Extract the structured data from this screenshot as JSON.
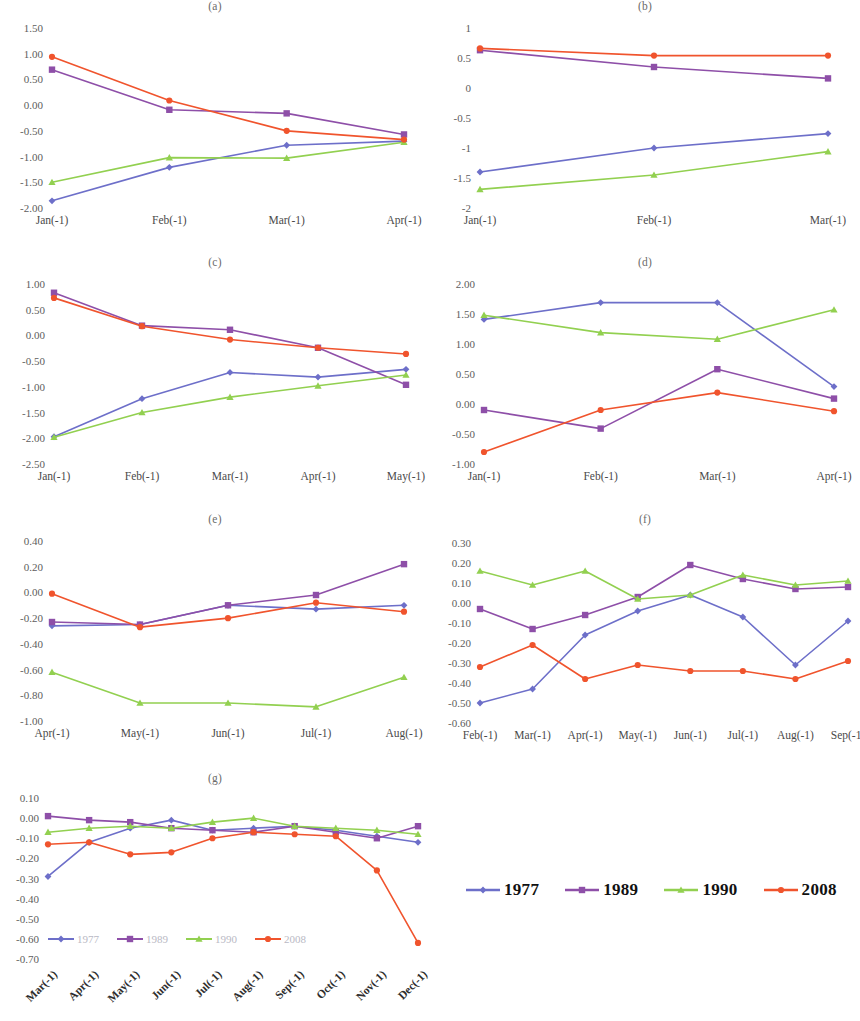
{
  "figure": {
    "background": "#ffffff",
    "width": 860,
    "height": 1021
  },
  "series_meta": [
    {
      "name": "1977",
      "color": "#6d6fc9",
      "marker": "diamond"
    },
    {
      "name": "1989",
      "color": "#8e4fa8",
      "marker": "square"
    },
    {
      "name": "1990",
      "color": "#92d050",
      "marker": "triangle"
    },
    {
      "name": "2008",
      "color": "#f0542d",
      "marker": "circle"
    }
  ],
  "legend_main": {
    "name": "figure-legend",
    "items": [
      {
        "label": "1977",
        "color": "#6d6fc9"
      },
      {
        "label": "1989",
        "color": "#8e4fa8"
      },
      {
        "label": "1990",
        "color": "#92d050"
      },
      {
        "label": "2008",
        "color": "#f0542d"
      }
    ]
  },
  "legend_inner_g": {
    "name": "panel-g-inline-legend",
    "items": [
      {
        "label": "1977",
        "color": "#6d6fc9"
      },
      {
        "label": "1989",
        "color": "#8e4fa8"
      },
      {
        "label": "1990",
        "color": "#92d050"
      },
      {
        "label": "2008",
        "color": "#f0542d"
      }
    ]
  },
  "chart_data": [
    {
      "id": "a",
      "type": "line",
      "title": "(a)",
      "xlabel": "",
      "ylabel": "",
      "grid": false,
      "legend": "none",
      "categories": [
        "Jan(-1)",
        "Feb(-1)",
        "Mar(-1)",
        "Apr(-1)"
      ],
      "yticks": [
        1.5,
        1.0,
        0.5,
        0.0,
        -0.5,
        -1.0,
        -1.5,
        -2.0
      ],
      "ytick_labels": [
        "1.50",
        "1.00",
        "0.50",
        "0.00",
        "-0.50",
        "-1.00",
        "-1.50",
        "-2.00"
      ],
      "ylim": [
        -2.0,
        1.5
      ],
      "series": [
        {
          "name": "1977",
          "color": "#6d6fc9",
          "values": [
            -1.86,
            -1.21,
            -0.78,
            -0.7
          ]
        },
        {
          "name": "1989",
          "color": "#8e4fa8",
          "values": [
            0.69,
            -0.09,
            -0.16,
            -0.57
          ]
        },
        {
          "name": "1990",
          "color": "#92d050",
          "values": [
            -1.5,
            -1.02,
            -1.03,
            -0.72
          ]
        },
        {
          "name": "2008",
          "color": "#f0542d",
          "values": [
            0.94,
            0.09,
            -0.5,
            -0.67
          ]
        }
      ]
    },
    {
      "id": "b",
      "type": "line",
      "title": "(b)",
      "xlabel": "",
      "ylabel": "",
      "grid": false,
      "legend": "none",
      "categories": [
        "Jan(-1)",
        "Feb(-1)",
        "Mar(-1)"
      ],
      "yticks": [
        1,
        0.5,
        0,
        -0.5,
        -1,
        -1.5,
        -2
      ],
      "ytick_labels": [
        "1",
        "0.5",
        "0",
        "-0.5",
        "-1",
        "-1.5",
        "-2"
      ],
      "ylim": [
        -2,
        1
      ],
      "series": [
        {
          "name": "1977",
          "color": "#6d6fc9",
          "values": [
            -1.4,
            -1.0,
            -0.76
          ]
        },
        {
          "name": "1989",
          "color": "#8e4fa8",
          "values": [
            0.63,
            0.35,
            0.16
          ]
        },
        {
          "name": "1990",
          "color": "#92d050",
          "values": [
            -1.69,
            -1.45,
            -1.06
          ]
        },
        {
          "name": "2008",
          "color": "#f0542d",
          "values": [
            0.66,
            0.54,
            0.54
          ]
        }
      ]
    },
    {
      "id": "c",
      "type": "line",
      "title": "(c)",
      "xlabel": "",
      "ylabel": "",
      "grid": false,
      "legend": "none",
      "categories": [
        "Jan(-1)",
        "Feb(-1)",
        "Mar(-1)",
        "Apr(-1)",
        "May(-1)"
      ],
      "yticks": [
        1.0,
        0.5,
        0.0,
        -0.5,
        -1.0,
        -1.5,
        -2.0,
        -2.5
      ],
      "ytick_labels": [
        "1.00",
        "0.50",
        "0.00",
        "-0.50",
        "-1.00",
        "-1.50",
        "-2.00",
        "-2.50"
      ],
      "ylim": [
        -2.5,
        1.0
      ],
      "series": [
        {
          "name": "1977",
          "color": "#6d6fc9",
          "values": [
            -1.97,
            -1.23,
            -0.72,
            -0.81,
            -0.66
          ]
        },
        {
          "name": "1989",
          "color": "#8e4fa8",
          "values": [
            0.83,
            0.19,
            0.11,
            -0.24,
            -0.96
          ]
        },
        {
          "name": "1990",
          "color": "#92d050",
          "values": [
            -1.98,
            -1.5,
            -1.2,
            -0.98,
            -0.77
          ]
        },
        {
          "name": "2008",
          "color": "#f0542d",
          "values": [
            0.73,
            0.18,
            -0.08,
            -0.24,
            -0.36
          ]
        }
      ]
    },
    {
      "id": "d",
      "type": "line",
      "title": "(d)",
      "xlabel": "",
      "ylabel": "",
      "grid": false,
      "legend": "none",
      "categories": [
        "Jan(-1)",
        "Feb(-1)",
        "Mar(-1)",
        "Apr(-1)"
      ],
      "yticks": [
        2.0,
        1.5,
        1.0,
        0.5,
        0.0,
        -0.5,
        -1.0
      ],
      "ytick_labels": [
        "2.00",
        "1.50",
        "1.00",
        "0.50",
        "0.00",
        "-0.50",
        "-1.00"
      ],
      "ylim": [
        -1.0,
        2.0
      ],
      "series": [
        {
          "name": "1977",
          "color": "#6d6fc9",
          "values": [
            1.41,
            1.69,
            1.69,
            0.29
          ]
        },
        {
          "name": "1989",
          "color": "#8e4fa8",
          "values": [
            -0.1,
            -0.41,
            0.58,
            0.09
          ]
        },
        {
          "name": "1990",
          "color": "#92d050",
          "values": [
            1.48,
            1.19,
            1.08,
            1.57
          ]
        },
        {
          "name": "2008",
          "color": "#f0542d",
          "values": [
            -0.8,
            -0.1,
            0.19,
            -0.12
          ]
        }
      ]
    },
    {
      "id": "e",
      "type": "line",
      "title": "(e)",
      "xlabel": "",
      "ylabel": "",
      "grid": false,
      "legend": "none",
      "categories": [
        "Apr(-1)",
        "May(-1)",
        "Jun(-1)",
        "Jul(-1)",
        "Aug(-1)"
      ],
      "yticks": [
        0.4,
        0.2,
        0.0,
        -0.2,
        -0.4,
        -0.6,
        -0.8,
        -1.0
      ],
      "ytick_labels": [
        "0.40",
        "0.20",
        "0.00",
        "-0.20",
        "-0.40",
        "-0.60",
        "-0.80",
        "-1.00"
      ],
      "ylim": [
        -1.0,
        0.4
      ],
      "series": [
        {
          "name": "1977",
          "color": "#6d6fc9",
          "values": [
            -0.26,
            -0.25,
            -0.1,
            -0.13,
            -0.1
          ]
        },
        {
          "name": "1989",
          "color": "#8e4fa8",
          "values": [
            -0.23,
            -0.25,
            -0.1,
            -0.02,
            0.22
          ]
        },
        {
          "name": "1990",
          "color": "#92d050",
          "values": [
            -0.62,
            -0.86,
            -0.86,
            -0.89,
            -0.66
          ]
        },
        {
          "name": "2008",
          "color": "#f0542d",
          "values": [
            -0.01,
            -0.27,
            -0.2,
            -0.08,
            -0.15
          ]
        }
      ]
    },
    {
      "id": "f",
      "type": "line",
      "title": "(f)",
      "xlabel": "",
      "ylabel": "",
      "grid": false,
      "legend": "none",
      "categories": [
        "Feb(-1)",
        "Mar(-1)",
        "Apr(-1)",
        "May(-1)",
        "Jun(-1)",
        "Jul(-1)",
        "Aug(-1)",
        "Sep(-1)"
      ],
      "yticks": [
        0.3,
        0.2,
        0.1,
        0.0,
        -0.1,
        -0.2,
        -0.3,
        -0.4,
        -0.5,
        -0.6
      ],
      "ytick_labels": [
        "0.30",
        "0.20",
        "0.10",
        "0.00",
        "-0.10",
        "-0.20",
        "-0.30",
        "-0.40",
        "-0.50",
        "-0.60"
      ],
      "ylim": [
        -0.6,
        0.3
      ],
      "series": [
        {
          "name": "1977",
          "color": "#6d6fc9",
          "values": [
            -0.5,
            -0.43,
            -0.16,
            -0.04,
            0.04,
            -0.07,
            -0.31,
            -0.09
          ]
        },
        {
          "name": "1989",
          "color": "#8e4fa8",
          "values": [
            -0.03,
            -0.13,
            -0.06,
            0.03,
            0.19,
            0.12,
            0.07,
            0.08
          ]
        },
        {
          "name": "1990",
          "color": "#92d050",
          "values": [
            0.16,
            0.09,
            0.16,
            0.02,
            0.04,
            0.14,
            0.09,
            0.11
          ]
        },
        {
          "name": "2008",
          "color": "#f0542d",
          "values": [
            -0.32,
            -0.21,
            -0.38,
            -0.31,
            -0.34,
            -0.34,
            -0.38,
            -0.29
          ]
        }
      ]
    },
    {
      "id": "g",
      "type": "line",
      "title": "(g)",
      "xlabel": "",
      "ylabel": "",
      "grid": false,
      "legend": "inline",
      "categories": [
        "Mar(-1)",
        "Apr(-1)",
        "May(-1)",
        "Jun(-1)",
        "Jul(-1)",
        "Aug(-1)",
        "Sep(-1)",
        "Oct(-1)",
        "Nov(-1)",
        "Dec(-1)"
      ],
      "yticks": [
        0.1,
        0.0,
        -0.1,
        -0.2,
        -0.3,
        -0.4,
        -0.5,
        -0.6,
        -0.7
      ],
      "ytick_labels": [
        "0.10",
        "0.00",
        "-0.10",
        "-0.20",
        "-0.30",
        "-0.40",
        "-0.50",
        "-0.60",
        "-0.70"
      ],
      "ylim": [
        -0.7,
        0.1
      ],
      "series": [
        {
          "name": "1977",
          "color": "#6d6fc9",
          "values": [
            -0.29,
            -0.12,
            -0.05,
            -0.01,
            -0.06,
            -0.05,
            -0.04,
            -0.06,
            -0.09,
            -0.12
          ]
        },
        {
          "name": "1989",
          "color": "#8e4fa8",
          "values": [
            0.01,
            -0.01,
            -0.02,
            -0.05,
            -0.06,
            -0.07,
            -0.04,
            -0.07,
            -0.1,
            -0.04
          ]
        },
        {
          "name": "1990",
          "color": "#92d050",
          "values": [
            -0.07,
            -0.05,
            -0.04,
            -0.05,
            -0.02,
            0.0,
            -0.04,
            -0.05,
            -0.06,
            -0.08
          ]
        },
        {
          "name": "2008",
          "color": "#f0542d",
          "values": [
            -0.13,
            -0.12,
            -0.18,
            -0.17,
            -0.1,
            -0.07,
            -0.08,
            -0.09,
            -0.26,
            -0.62
          ]
        }
      ]
    }
  ]
}
